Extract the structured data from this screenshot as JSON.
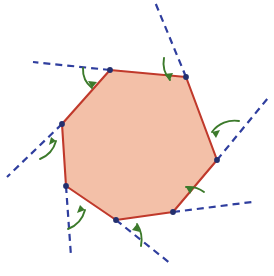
{
  "figure": {
    "width": 274,
    "height": 276,
    "background_color": "#FFFFFF"
  },
  "colors": {
    "polygon_fill": "#F3C0A8",
    "polygon_stroke": "#C0392B",
    "ray_stroke": "#2F3E9E",
    "vertex_dot": "#23306E",
    "angle_arrow": "#3C7A2B"
  },
  "style": {
    "polygon_stroke_width": 2.1,
    "ray_stroke_width": 2.2,
    "ray_dash": "7 5",
    "vertex_radius": 2.9,
    "angle_arrow_width": 1.9
  },
  "polygon": {
    "name": "heptagon",
    "sides": 7,
    "vertices": [
      {
        "label": "A",
        "x": 110,
        "y": 70
      },
      {
        "label": "B",
        "x": 186,
        "y": 77
      },
      {
        "label": "C",
        "x": 217,
        "y": 160
      },
      {
        "label": "D",
        "x": 173,
        "y": 212
      },
      {
        "label": "E",
        "x": 116,
        "y": 220
      },
      {
        "label": "F",
        "x": 66,
        "y": 186
      },
      {
        "label": "G",
        "x": 62,
        "y": 124
      }
    ],
    "points_attr": "110,70 186,77 217,160 173,212 116,220 66,186 62,124"
  },
  "extension_rays": [
    {
      "name": "ray-at-A",
      "from_vertex": "A",
      "x1": 110,
      "y1": 70,
      "x2": 33,
      "y2": 62
    },
    {
      "name": "ray-at-B",
      "from_vertex": "B",
      "x1": 186,
      "y1": 77,
      "x2": 155,
      "y2": 2
    },
    {
      "name": "ray-at-C",
      "from_vertex": "C",
      "x1": 217,
      "y1": 160,
      "x2": 268,
      "y2": 98
    },
    {
      "name": "ray-at-D",
      "from_vertex": "D",
      "x1": 173,
      "y1": 212,
      "x2": 252,
      "y2": 202
    },
    {
      "name": "ray-at-E",
      "from_vertex": "E",
      "x1": 116,
      "y1": 220,
      "x2": 171,
      "y2": 264
    },
    {
      "name": "ray-at-F",
      "from_vertex": "F",
      "x1": 66,
      "y1": 186,
      "x2": 71,
      "y2": 256
    },
    {
      "name": "ray-at-G",
      "from_vertex": "G",
      "x1": 62,
      "y1": 124,
      "x2": 7,
      "y2": 177
    }
  ],
  "angle_arrows": [
    {
      "name": "exterior-angle-A",
      "at_vertex": "A",
      "path": "M 83 68 A 24 24 0 0 0 92 88",
      "head": "92,88 88,81 97,82"
    },
    {
      "name": "exterior-angle-B",
      "at_vertex": "B",
      "path": "M 164 58 A 26 26 0 0 0 170 80",
      "head": "170,80 164,74 173,73"
    },
    {
      "name": "exterior-angle-C",
      "at_vertex": "C",
      "path": "M 239 121 A 28 28 0 0 0 212 132",
      "head": "212,132 220,130 216,138"
    },
    {
      "name": "exterior-angle-D",
      "at_vertex": "D",
      "path": "M 204 192 A 26 26 0 0 0 186 187",
      "head": "186,187 194,187 190,194"
    },
    {
      "name": "exterior-angle-E",
      "at_vertex": "E",
      "path": "M 141 246 A 30 30 0 0 0 137 224",
      "head": "137,224 140,232 132,230"
    },
    {
      "name": "exterior-angle-F",
      "at_vertex": "F",
      "path": "M 68 229 A 28 28 0 0 0 85 210",
      "head": "85,210 77,213 80,205"
    },
    {
      "name": "exterior-angle-G",
      "at_vertex": "G",
      "path": "M 40 159 A 27 27 0 0 0 56 141",
      "head": "56,141 49,145 51,137"
    }
  ],
  "labels": {
    "none_visible": ""
  }
}
